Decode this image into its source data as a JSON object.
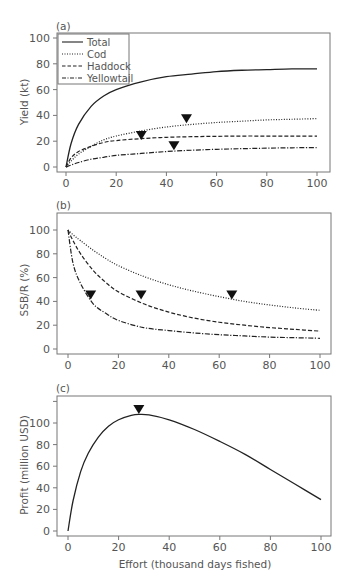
{
  "chart_data": [
    {
      "panel": "(a)",
      "type": "line",
      "title": "",
      "xlabel": "",
      "ylabel": "Yield (kt)",
      "xlim": [
        0,
        100
      ],
      "ylim": [
        0,
        100
      ],
      "xticks": [
        0,
        20,
        40,
        60,
        80,
        100
      ],
      "yticks": [
        0,
        20,
        40,
        60,
        80,
        100
      ],
      "grid": false,
      "legend_position": "upper left",
      "legend": [
        "Total",
        "Cod",
        "Haddock",
        "Yellowtail"
      ],
      "x": [
        0,
        2,
        5,
        10,
        15,
        20,
        30,
        40,
        50,
        60,
        70,
        80,
        90,
        100
      ],
      "series": [
        {
          "name": "Total",
          "style": "solid",
          "values": [
            0,
            18,
            33,
            47,
            55,
            60,
            66,
            70,
            72,
            74,
            75,
            75.5,
            76,
            76
          ]
        },
        {
          "name": "Cod",
          "style": "dotted",
          "values": [
            0,
            4.5,
            10,
            16,
            21,
            24,
            28,
            31,
            33,
            34.5,
            35.5,
            36.5,
            37,
            37.5
          ]
        },
        {
          "name": "Haddock",
          "style": "dashed",
          "values": [
            0,
            7,
            12,
            16,
            19,
            20.5,
            22,
            23,
            23.5,
            23.8,
            24,
            24,
            24,
            24
          ]
        },
        {
          "name": "Yellowtail",
          "style": "dashdot",
          "values": [
            0,
            1.5,
            3.5,
            6,
            7.5,
            9,
            10.5,
            12,
            13,
            13.7,
            14.2,
            14.6,
            14.9,
            15
          ]
        }
      ],
      "markers": [
        {
          "x": 30,
          "y": 24,
          "series": "Haddock",
          "shape": "down-triangle"
        },
        {
          "x": 48,
          "y": 37,
          "series": "Cod",
          "shape": "down-triangle"
        },
        {
          "x": 43,
          "y": 16,
          "series": "Yellowtail",
          "shape": "down-triangle"
        }
      ]
    },
    {
      "panel": "(b)",
      "type": "line",
      "title": "",
      "xlabel": "",
      "ylabel": "SSB/R (%)",
      "xlim": [
        0,
        100
      ],
      "ylim": [
        0,
        110
      ],
      "xticks": [
        0,
        20,
        40,
        60,
        80,
        100
      ],
      "yticks": [
        0,
        20,
        40,
        60,
        80,
        100
      ],
      "grid": false,
      "x": [
        0,
        2,
        5,
        10,
        15,
        20,
        30,
        40,
        50,
        60,
        70,
        80,
        90,
        100
      ],
      "series": [
        {
          "name": "Cod",
          "style": "dotted",
          "values": [
            100,
            96,
            91,
            83,
            76,
            70,
            61,
            54,
            48.5,
            44,
            40,
            37,
            34.5,
            32.5
          ]
        },
        {
          "name": "Haddock",
          "style": "dashed",
          "values": [
            100,
            91,
            80,
            66,
            56,
            48,
            38,
            31,
            26,
            22.5,
            20,
            18,
            16.5,
            15
          ]
        },
        {
          "name": "Yellowtail",
          "style": "dashdot",
          "values": [
            100,
            72,
            55,
            38,
            30,
            24,
            18,
            15.5,
            13.5,
            12,
            11,
            10,
            9.5,
            9
          ]
        }
      ],
      "markers": [
        {
          "x": 9,
          "y": 45,
          "series": "Yellowtail",
          "shape": "down-triangle"
        },
        {
          "x": 29,
          "y": 45,
          "series": "Haddock",
          "shape": "down-triangle"
        },
        {
          "x": 65,
          "y": 45,
          "series": "Cod",
          "shape": "down-triangle"
        }
      ]
    },
    {
      "panel": "(c)",
      "type": "line",
      "title": "",
      "xlabel": "Effort (thousand days fished)",
      "ylabel": "Profit (million USD)",
      "xlim": [
        0,
        100
      ],
      "ylim": [
        0,
        120
      ],
      "xticks": [
        0,
        20,
        40,
        60,
        80,
        100
      ],
      "yticks": [
        0,
        20,
        40,
        60,
        80,
        100,
        120
      ],
      "ytick_labels": [
        "0",
        "20",
        "40",
        "60",
        "80",
        "100",
        ""
      ],
      "grid": false,
      "x": [
        0,
        2,
        5,
        8,
        12,
        16,
        20,
        25,
        28,
        32,
        40,
        50,
        60,
        70,
        80,
        90,
        100
      ],
      "series": [
        {
          "name": "Profit",
          "style": "solid",
          "values": [
            0,
            28,
            55,
            72,
            87,
            97,
            103,
            107,
            108,
            107.5,
            103,
            94,
            83,
            71,
            57,
            43,
            29
          ]
        }
      ],
      "markers": [
        {
          "x": 28,
          "y": 112,
          "series": "Profit",
          "shape": "down-triangle"
        }
      ]
    }
  ]
}
